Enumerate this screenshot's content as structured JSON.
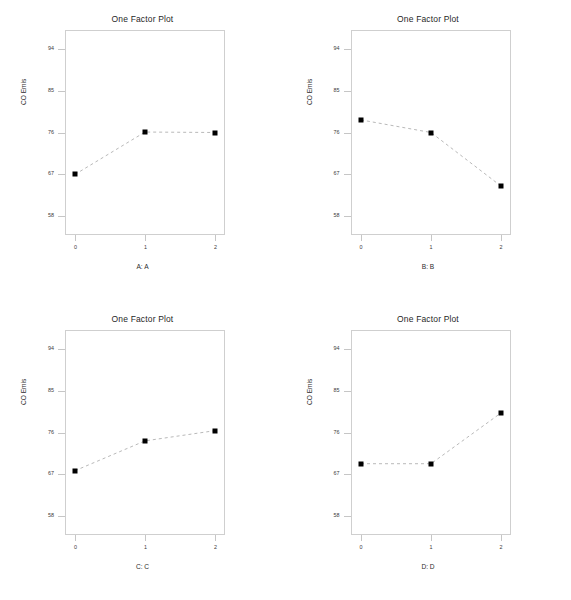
{
  "figure": {
    "panel_title": "One Factor Plot",
    "ylabel": "CO Emis",
    "y_ticks": [
      "58",
      "67",
      "76",
      "85",
      "94"
    ],
    "x_ticks": [
      "0",
      "1",
      "2"
    ],
    "marker_color": "#000000",
    "line_color": "#b9b9b9",
    "frame_color": "#cfcfcf"
  },
  "chart_data": [
    {
      "type": "line",
      "title": "One Factor Plot",
      "xlabel": "A: A",
      "ylabel": "CO Emis",
      "categories": [
        "0",
        "1",
        "2"
      ],
      "values": [
        67.0,
        76.1,
        76.0
      ],
      "ylim": [
        54,
        98
      ],
      "yticks": [
        58,
        67,
        76,
        85,
        94
      ],
      "grid": false,
      "legend": "none",
      "linestyle": "dashed",
      "marker": "square"
    },
    {
      "type": "line",
      "title": "One Factor Plot",
      "xlabel": "B: B",
      "ylabel": "CO Emis",
      "categories": [
        "0",
        "1",
        "2"
      ],
      "values": [
        78.7,
        76.0,
        64.5
      ],
      "ylim": [
        54,
        98
      ],
      "yticks": [
        58,
        67,
        76,
        85,
        94
      ],
      "grid": false,
      "legend": "none",
      "linestyle": "dashed",
      "marker": "square"
    },
    {
      "type": "line",
      "title": "One Factor Plot",
      "xlabel": "C: C",
      "ylabel": "CO Emis",
      "categories": [
        "0",
        "1",
        "2"
      ],
      "values": [
        67.8,
        74.2,
        76.4
      ],
      "ylim": [
        54,
        98
      ],
      "yticks": [
        58,
        67,
        76,
        85,
        94
      ],
      "grid": false,
      "legend": "none",
      "linestyle": "dashed",
      "marker": "square"
    },
    {
      "type": "line",
      "title": "One Factor Plot",
      "xlabel": "D: D",
      "ylabel": "CO Emis",
      "categories": [
        "0",
        "1",
        "2"
      ],
      "values": [
        69.3,
        69.3,
        80.2
      ],
      "ylim": [
        54,
        98
      ],
      "yticks": [
        58,
        67,
        76,
        85,
        94
      ],
      "grid": false,
      "legend": "none",
      "linestyle": "dashed",
      "marker": "square"
    }
  ]
}
